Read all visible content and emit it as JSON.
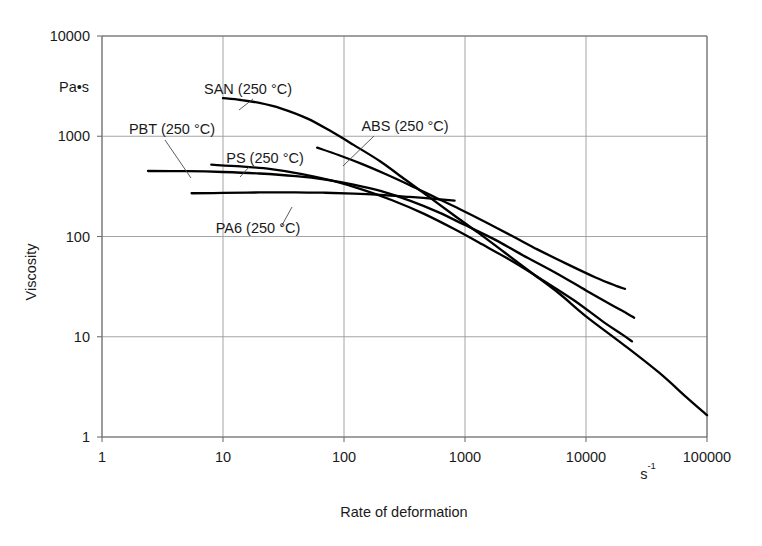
{
  "figure": {
    "background_color": "#ffffff",
    "line_color": "#000000",
    "grid_color": "#9a9a9a",
    "axis_color": "#6f6f6f",
    "text_color": "#1a1a1a"
  },
  "chart_data": {
    "type": "line",
    "title": "",
    "subtitle": "",
    "xlabel": "Rate of deformation",
    "ylabel": "Viscosity",
    "x_unit": "s",
    "x_unit_exponent": "-1",
    "y_unit": "Pa•s",
    "xscale": "log",
    "yscale": "log",
    "xlim": [
      1,
      100000
    ],
    "ylim": [
      1,
      10000
    ],
    "xticks": [
      1,
      10,
      100,
      1000,
      10000,
      100000
    ],
    "xtick_labels": [
      "1",
      "10",
      "100",
      "1000",
      "10000",
      "100000"
    ],
    "yticks": [
      1,
      10,
      100,
      1000,
      10000
    ],
    "ytick_labels": [
      "1",
      "10",
      "100",
      "1000",
      "10000"
    ],
    "grid": true,
    "legend_position": "inline-annotations",
    "series": [
      {
        "name": "SAN (250 °C)",
        "label": "SAN (250 °C)",
        "points": [
          [
            10,
            2400
          ],
          [
            14,
            2300
          ],
          [
            20,
            2150
          ],
          [
            30,
            1900
          ],
          [
            50,
            1500
          ],
          [
            80,
            1100
          ],
          [
            120,
            820
          ],
          [
            200,
            560
          ],
          [
            320,
            370
          ],
          [
            500,
            250
          ],
          [
            800,
            165
          ],
          [
            1300,
            108
          ],
          [
            2100,
            70
          ],
          [
            3500,
            44
          ],
          [
            6000,
            27
          ],
          [
            10000,
            16
          ],
          [
            20000,
            8.5
          ],
          [
            40000,
            4.4
          ],
          [
            70000,
            2.4
          ],
          [
            100000,
            1.65
          ]
        ]
      },
      {
        "name": "PBT (250 °C)",
        "label": "PBT (250 °C)",
        "points": [
          [
            2.4,
            450
          ],
          [
            5,
            448
          ],
          [
            10,
            440
          ],
          [
            20,
            425
          ],
          [
            40,
            400
          ],
          [
            70,
            370
          ],
          [
            120,
            330
          ],
          [
            200,
            285
          ],
          [
            350,
            228
          ],
          [
            600,
            175
          ],
          [
            1000,
            130
          ],
          [
            1800,
            92
          ],
          [
            3000,
            65
          ],
          [
            5500,
            44
          ],
          [
            10000,
            29
          ],
          [
            16000,
            21
          ],
          [
            22000,
            17
          ],
          [
            25000,
            15.5
          ]
        ]
      },
      {
        "name": "PS (250 °C)",
        "label": "PS (250 °C)",
        "points": [
          [
            8,
            520
          ],
          [
            14,
            500
          ],
          [
            25,
            470
          ],
          [
            45,
            420
          ],
          [
            80,
            360
          ],
          [
            140,
            295
          ],
          [
            250,
            230
          ],
          [
            450,
            170
          ],
          [
            800,
            120
          ],
          [
            1400,
            83
          ],
          [
            2500,
            56
          ],
          [
            4500,
            36
          ],
          [
            8000,
            23
          ],
          [
            14000,
            14
          ],
          [
            20000,
            10.5
          ],
          [
            24000,
            9
          ]
        ]
      },
      {
        "name": "ABS (250 °C)",
        "label": "ABS (250 °C)",
        "points": [
          [
            60,
            770
          ],
          [
            90,
            650
          ],
          [
            140,
            530
          ],
          [
            220,
            420
          ],
          [
            350,
            325
          ],
          [
            550,
            250
          ],
          [
            900,
            188
          ],
          [
            1500,
            138
          ],
          [
            2500,
            100
          ],
          [
            4000,
            74
          ],
          [
            7000,
            53
          ],
          [
            12000,
            39
          ],
          [
            18000,
            32
          ],
          [
            21000,
            30
          ]
        ]
      },
      {
        "name": "PA6 (250 °C)",
        "label": "PA6 (250 °C)",
        "points": [
          [
            5.5,
            270
          ],
          [
            10,
            272
          ],
          [
            20,
            275
          ],
          [
            40,
            276
          ],
          [
            70,
            273
          ],
          [
            120,
            268
          ],
          [
            200,
            260
          ],
          [
            350,
            248
          ],
          [
            500,
            240
          ],
          [
            700,
            232
          ],
          [
            820,
            228
          ]
        ]
      }
    ],
    "annotations": [
      {
        "text": "SAN (250 °C)",
        "label_x": 248,
        "label_y": 94,
        "anchor": "middle",
        "leader": [
          [
            253,
            99
          ],
          [
            239,
            110
          ]
        ]
      },
      {
        "text": "PBT (250 °C)",
        "label_x": 172,
        "label_y": 134,
        "anchor": "middle",
        "leader": [
          [
            165,
            140
          ],
          [
            191,
            178
          ]
        ]
      },
      {
        "text": "PS (250 °C)",
        "label_x": 265,
        "label_y": 163,
        "anchor": "middle",
        "leader": [
          [
            249,
            167
          ],
          [
            240,
            177
          ]
        ]
      },
      {
        "text": "ABS (250 °C)",
        "label_x": 405,
        "label_y": 131,
        "anchor": "middle",
        "leader": [
          [
            374,
            136
          ],
          [
            343,
            166
          ]
        ]
      },
      {
        "text": "PA6 (250 °C)",
        "label_x": 258,
        "label_y": 233,
        "anchor": "middle",
        "leader": [
          [
            281,
            227
          ],
          [
            292,
            207
          ]
        ]
      }
    ]
  }
}
